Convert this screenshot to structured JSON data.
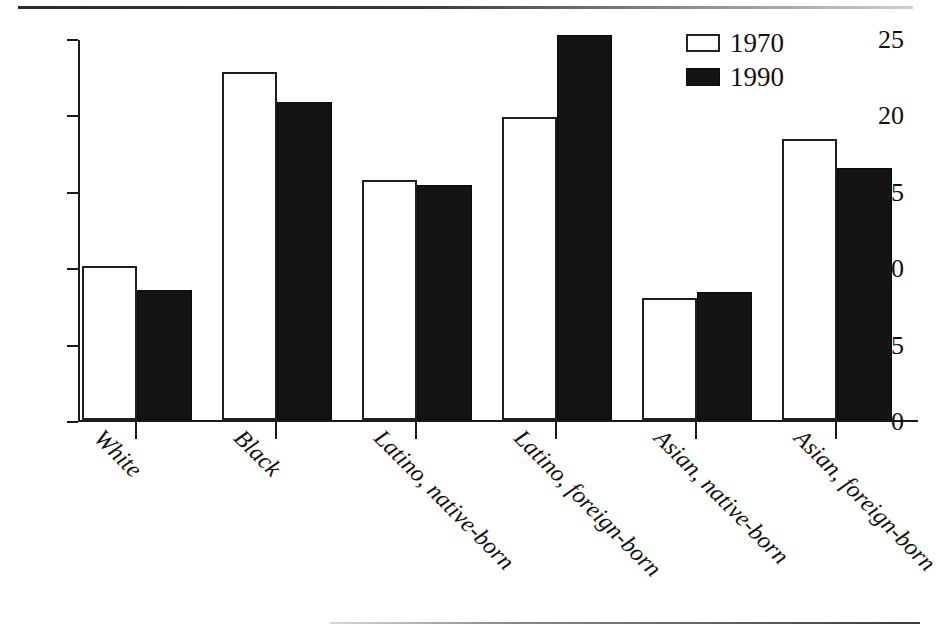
{
  "chart_data": {
    "type": "bar",
    "title": "",
    "xlabel": "",
    "ylabel": "",
    "categories": [
      "White",
      "Black",
      "Latino, native-born",
      "Latino, foreign-born",
      "Asian, native-born",
      "Asian, foreign-born"
    ],
    "series": [
      {
        "name": "1970",
        "values": [
          10.1,
          22.8,
          15.7,
          19.8,
          8.0,
          18.4
        ],
        "color": "#ffffff"
      },
      {
        "name": "1990",
        "values": [
          8.5,
          20.8,
          15.4,
          25.2,
          8.4,
          16.5
        ],
        "color": "#141414"
      }
    ],
    "ylim": [
      0,
      25
    ],
    "ytick_labels": [
      "25",
      "20",
      "15",
      "10",
      "5",
      "0"
    ],
    "ytick_values": [
      25,
      20,
      15,
      10,
      5,
      0
    ],
    "grid": false,
    "legend_position": "top-right",
    "xlabel_rotation": 45
  },
  "legend": {
    "items": [
      {
        "label": "1970",
        "swatch": "hollow-square-icon"
      },
      {
        "label": "1990",
        "swatch": "filled-square-icon"
      }
    ]
  }
}
